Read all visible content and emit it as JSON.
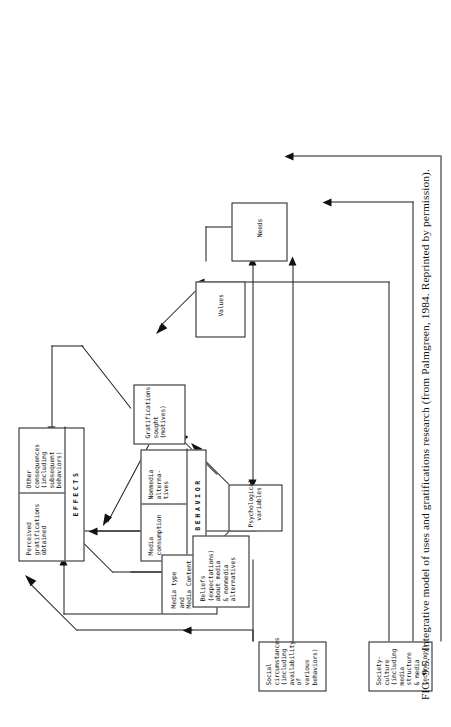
{
  "figure": {
    "caption_number": "FIG. 9.5.",
    "caption_text": "Integrative model of uses and gratifications research (from Palmgreen, 1984. Reprinted by permission)."
  },
  "nodes": {
    "social_circumstances": {
      "name": "social-circumstances",
      "label": "Social\ncircumstances\n(including\navailability of\nvarious behaviors)"
    },
    "society_culture": {
      "name": "society-culture",
      "label": "Society-culture\n(including\nmedia structure\n& media\ntechnology)"
    },
    "psychological_variables": {
      "name": "psychological-variables",
      "label": "Psychological\nvariables"
    },
    "needs": {
      "name": "needs",
      "label": "Needs"
    },
    "values": {
      "name": "values",
      "label": "Values"
    },
    "beliefs": {
      "name": "beliefs",
      "label": "Beliefs\n(expectations)\nabout media\n& nonmedia\nalternatives"
    },
    "gratifications_sought": {
      "name": "gratifications-sought",
      "label": "Gratifications\nsought\n(motives)"
    },
    "media_type_content": {
      "name": "media-type-and-content",
      "label": "Media type\nand\nMedia Content"
    },
    "behavior_box": {
      "name": "behavior-box",
      "band_label": "BEHAVIOR",
      "cell_left": "Media\nconsumption",
      "cell_right": "Nonmedia\nalterna-\ntives"
    },
    "effects_box": {
      "name": "effects-box",
      "band_label": "EFFECTS",
      "cell_left": "Perceived\ngratifications\nobtained",
      "cell_right": "Other consequences\n(including subsequent\nbehaviors)"
    }
  },
  "colors": {
    "ink": "#1a1a1a",
    "paper": "#ffffff"
  }
}
